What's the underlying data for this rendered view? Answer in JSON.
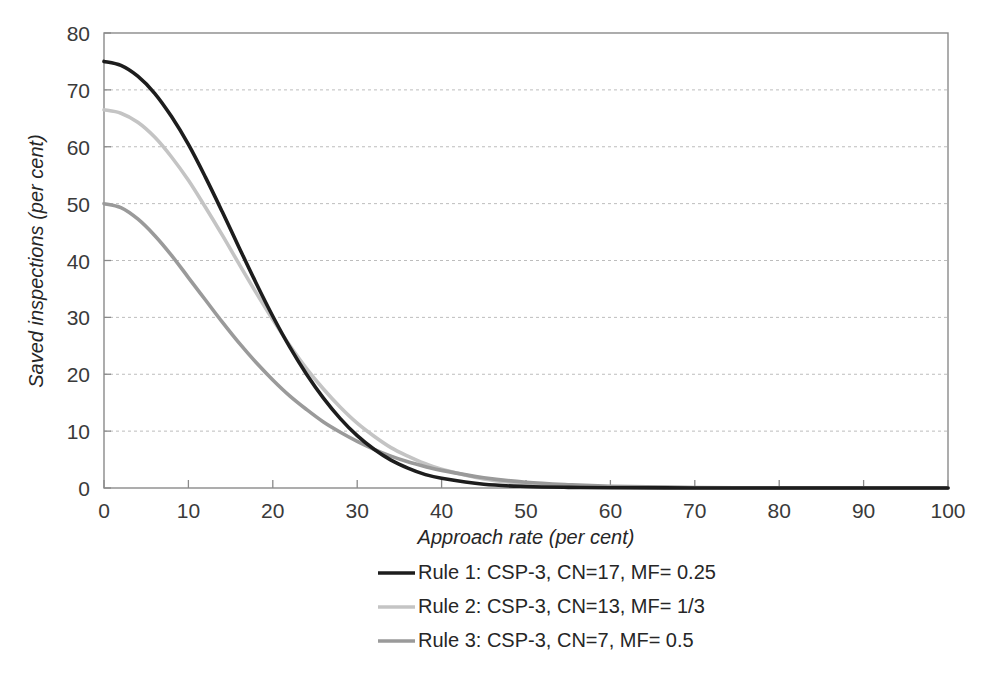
{
  "chart_data": {
    "type": "line",
    "title": "",
    "xlabel": "Approach rate (per cent)",
    "ylabel": "Saved inspections (per cent)",
    "xlim": [
      0,
      100
    ],
    "ylim": [
      0,
      80
    ],
    "xticks": [
      0,
      10,
      20,
      30,
      40,
      50,
      60,
      70,
      80,
      90,
      100
    ],
    "yticks": [
      0,
      10,
      20,
      30,
      40,
      50,
      60,
      70,
      80
    ],
    "grid": "horizontal-dashed",
    "legend_position": "bottom-center",
    "x": [
      0,
      2,
      4,
      6,
      8,
      10,
      12,
      14,
      16,
      18,
      20,
      22,
      24,
      26,
      28,
      30,
      32,
      34,
      36,
      38,
      40,
      45,
      50,
      55,
      60,
      70,
      80,
      90,
      100
    ],
    "series": [
      {
        "name": "Rule 1: CSP-3, CN=17, MF= 0.25",
        "color": "#1d1d1d",
        "values": [
          75.0,
          74.3,
          72.4,
          69.4,
          65.3,
          60.4,
          54.7,
          48.6,
          42.3,
          36.1,
          30.2,
          24.8,
          20.0,
          15.8,
          12.2,
          9.2,
          6.8,
          4.9,
          3.5,
          2.4,
          1.7,
          0.65,
          0.26,
          0.11,
          0.05,
          0.01,
          0.0,
          0.0,
          0.0
        ]
      },
      {
        "name": "Rule 2: CSP-3, CN=13, MF= 1/3",
        "color": "#c4c4c4",
        "values": [
          66.5,
          65.9,
          64.3,
          61.7,
          58.2,
          54.1,
          49.4,
          44.5,
          39.4,
          34.4,
          29.6,
          25.1,
          21.0,
          17.4,
          14.2,
          11.4,
          9.1,
          7.1,
          5.6,
          4.3,
          3.3,
          1.6,
          0.76,
          0.36,
          0.17,
          0.04,
          0.01,
          0.0,
          0.0
        ]
      },
      {
        "name": "Rule 3: CSP-3, CN=7, MF= 0.5",
        "color": "#9a9a9a",
        "values": [
          50.0,
          49.3,
          47.3,
          44.4,
          40.9,
          37.0,
          33.1,
          29.2,
          25.5,
          22.1,
          19.0,
          16.2,
          13.8,
          11.6,
          9.8,
          8.2,
          6.8,
          5.6,
          4.6,
          3.8,
          3.1,
          1.8,
          1.0,
          0.58,
          0.32,
          0.1,
          0.03,
          0.01,
          0.0
        ]
      }
    ]
  },
  "axes": {
    "y_title": "Saved inspections (per cent)",
    "x_title": "Approach rate (per cent)",
    "y_tick_labels": [
      "80",
      "70",
      "60",
      "50",
      "40",
      "30",
      "20",
      "10",
      "0"
    ],
    "x_tick_labels": [
      "0",
      "10",
      "20",
      "30",
      "40",
      "50",
      "60",
      "70",
      "80",
      "90",
      "100"
    ]
  },
  "legend": {
    "entries": [
      {
        "label": "Rule 1: CSP-3, CN=17, MF= 0.25",
        "color": "#1d1d1d"
      },
      {
        "label": "Rule 2: CSP-3, CN=13, MF= 1/3",
        "color": "#c4c4c4"
      },
      {
        "label": "Rule 3: CSP-3, CN=7, MF= 0.5",
        "color": "#9a9a9a"
      }
    ]
  },
  "colors": {
    "frame": "#8a8a8a",
    "grid": "#bdbdbd",
    "text": "#262626",
    "background": "#ffffff"
  }
}
